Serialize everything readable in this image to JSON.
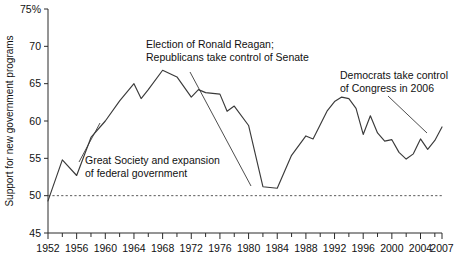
{
  "chart_data": {
    "type": "line",
    "title": "",
    "xlabel": "",
    "ylabel": "Support for new government programs",
    "xlim": [
      1952,
      2007
    ],
    "ylim": [
      45,
      75
    ],
    "grid": false,
    "legend": null,
    "y_tick_labels": [
      "75%",
      "70",
      "65",
      "60",
      "55",
      "50",
      "45"
    ],
    "y_ticks": [
      75,
      70,
      65,
      60,
      55,
      50,
      45
    ],
    "x_tick_labels": [
      "1952",
      "1956",
      "1960",
      "1964",
      "1968",
      "1972",
      "1976",
      "1980",
      "1984",
      "1988",
      "1992",
      "1996",
      "2000",
      "2004",
      "2007"
    ],
    "x_ticks": [
      1952,
      1956,
      1960,
      1964,
      1968,
      1972,
      1976,
      1980,
      1984,
      1988,
      1992,
      1996,
      2000,
      2004,
      2007
    ],
    "x_minor_step": 2,
    "reference_line": {
      "value": 50,
      "style": "dashed",
      "label": ""
    },
    "series": [
      {
        "name": "Support for new government programs",
        "color": "#3a3a3a",
        "x": [
          1952,
          1954,
          1956,
          1958,
          1960,
          1962,
          1964,
          1965,
          1966,
          1968,
          1970,
          1972,
          1973,
          1974,
          1976,
          1977,
          1978,
          1980,
          1982,
          1984,
          1985,
          1986,
          1988,
          1989,
          1990,
          1991,
          1992,
          1993,
          1994,
          1995,
          1996,
          1997,
          1998,
          1999,
          2000,
          2001,
          2002,
          2003,
          2004,
          2005,
          2006,
          2007
        ],
        "values": [
          49.3,
          54.8,
          52.7,
          57.8,
          60.0,
          62.7,
          65.0,
          63.0,
          64.2,
          66.8,
          65.9,
          63.2,
          64.2,
          63.8,
          63.6,
          61.3,
          62.0,
          59.4,
          51.2,
          51.0,
          53.2,
          55.4,
          58.0,
          57.6,
          59.5,
          61.4,
          62.6,
          63.2,
          63.0,
          61.7,
          58.2,
          60.7,
          58.4,
          57.3,
          57.5,
          55.8,
          54.9,
          55.6,
          57.6,
          56.2,
          57.4,
          59.2
        ]
      }
    ],
    "annotations": [
      {
        "id": "great-society",
        "lines": [
          "Great Society and expansion",
          "of federal government"
        ],
        "text_x": 85,
        "text_y": 164,
        "leader": {
          "x1": 79,
          "y1": 162,
          "x2": 100,
          "y2": 123
        }
      },
      {
        "id": "reagan-election",
        "lines": [
          "Election of Ronald Reagan;",
          "Republicans take control of Senate"
        ],
        "text_x": 146,
        "text_y": 48,
        "leader": {
          "x1": 190,
          "y1": 72,
          "x2": 251,
          "y2": 186
        }
      },
      {
        "id": "democrats-congress",
        "lines": [
          "Democrats take control",
          "of Congress in 2006"
        ],
        "text_x": 340,
        "text_y": 79,
        "leader": {
          "x1": 388,
          "y1": 96,
          "x2": 427,
          "y2": 133
        }
      }
    ]
  },
  "geometry": {
    "plot_left": 48,
    "plot_right": 442,
    "plot_top": 9,
    "plot_bottom": 233
  }
}
